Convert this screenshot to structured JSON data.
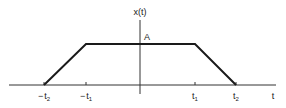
{
  "diagram": {
    "type": "trapezoidal-pulse",
    "y_axis_label": "x(t)",
    "x_axis_label": "t",
    "amplitude_label": "A",
    "ticks": [
      {
        "sign": "−",
        "base": "t",
        "sub": "2"
      },
      {
        "sign": "−",
        "base": "t",
        "sub": "1"
      },
      {
        "sign": "",
        "base": "t",
        "sub": "1"
      },
      {
        "sign": "",
        "base": "t",
        "sub": "2"
      }
    ],
    "colors": {
      "line": "#222222",
      "background": "#ffffff"
    }
  }
}
